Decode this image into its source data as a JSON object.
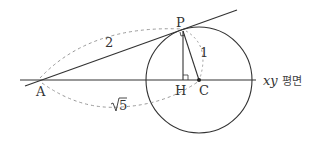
{
  "diagram": {
    "points": {
      "A": "A",
      "P": "P",
      "H": "H",
      "C": "C"
    },
    "lengths": {
      "AP": "2",
      "PC": "1",
      "AC_radicand": "5"
    },
    "plane_label": {
      "var": "xy",
      "text": "평면"
    },
    "colors": {
      "line": "#333333",
      "dashed": "#999999",
      "background": "#ffffff"
    }
  }
}
